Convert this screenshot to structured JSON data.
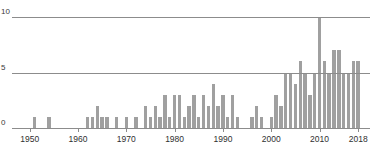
{
  "chart_data": {
    "type": "bar",
    "title": "",
    "subtitle": "",
    "xlabel": "",
    "ylabel": "",
    "xlim": [
      1947,
      2019
    ],
    "ylim": [
      0,
      10
    ],
    "grid": true,
    "legend": null,
    "bar_color": "#a0a0a0",
    "axis_color": "#8c8c8c",
    "background": "#ffffff",
    "y_ticks": [
      0,
      5,
      10
    ],
    "y_tick_labels": [
      "0",
      "5",
      "10"
    ],
    "x_ticks": [
      1950,
      1960,
      1970,
      1980,
      1990,
      2000,
      2010,
      2018
    ],
    "x_tick_labels": [
      "1950",
      "1960",
      "1970",
      "1980",
      "1990",
      "2000",
      "2010",
      "2018"
    ],
    "categories": [
      1951,
      1954,
      1962,
      1963,
      1964,
      1965,
      1966,
      1968,
      1970,
      1972,
      1974,
      1975,
      1976,
      1977,
      1978,
      1979,
      1980,
      1981,
      1982,
      1983,
      1984,
      1985,
      1986,
      1987,
      1988,
      1989,
      1990,
      1991,
      1992,
      1993,
      1996,
      1997,
      1998,
      2000,
      2001,
      2002,
      2003,
      2004,
      2005,
      2006,
      2007,
      2008,
      2009,
      2010,
      2011,
      2012,
      2013,
      2014,
      2015,
      2016,
      2017,
      2018
    ],
    "values": [
      1,
      1,
      1,
      1,
      2,
      1,
      1,
      1,
      1,
      1,
      2,
      1,
      2,
      1,
      3,
      1,
      3,
      3,
      1,
      2,
      3,
      1,
      3,
      2,
      4,
      2,
      3,
      1,
      3,
      1,
      1,
      2,
      1,
      1,
      3,
      2,
      5,
      5,
      4,
      6,
      5,
      3,
      5,
      10,
      6,
      5,
      7,
      7,
      5,
      5,
      6,
      6
    ]
  }
}
